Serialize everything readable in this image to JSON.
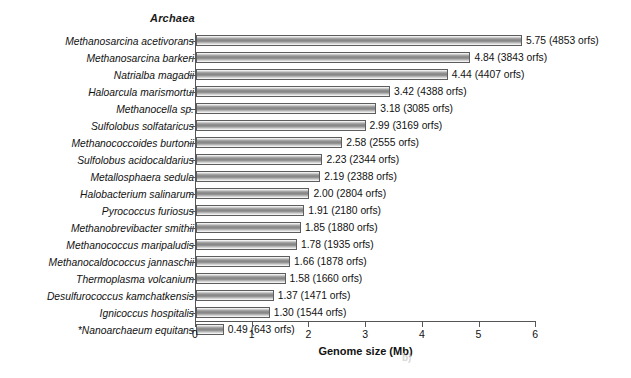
{
  "chart_data": {
    "type": "bar",
    "orientation": "horizontal",
    "title": "Archaea",
    "xlabel": "Genome size (Mb)",
    "ylabel": "",
    "xlim": [
      0,
      6
    ],
    "xticks": [
      0,
      1,
      2,
      3,
      4,
      5,
      6
    ],
    "xtick_labels": [
      "0",
      "1",
      "2",
      "3",
      "4",
      "5",
      "6"
    ],
    "grid": false,
    "legend": null,
    "categories": [
      "Methanosarcina acetivorans",
      "Methanosarcina barkeri",
      "Natrialba magadii",
      "Haloarcula marismortui",
      "Methanocella sp.",
      "Sulfolobus solfataricus",
      "Methanococcoides burtonii",
      "Sulfolobus acidocaldarius",
      "Metallosphaera sedula",
      "Halobacterium salinarum",
      "Pyrococcus furiosus",
      "Methanobrevibacter smithii",
      "Methanococcus maripaludis",
      "Methanocaldococcus jannaschii",
      "Thermoplasma volcanium",
      "Desulfurococcus kamchatkensis",
      "Ignicoccus hospitalis",
      "*Nanoarchaeum equitans"
    ],
    "values": [
      5.75,
      4.84,
      4.44,
      3.42,
      3.18,
      2.99,
      2.58,
      2.23,
      2.19,
      2.0,
      1.91,
      1.85,
      1.78,
      1.66,
      1.58,
      1.37,
      1.3,
      0.49
    ],
    "orfs": [
      4853,
      3843,
      4407,
      4388,
      3085,
      3169,
      2555,
      2344,
      2388,
      2804,
      2180,
      1880,
      1935,
      1878,
      1660,
      1471,
      1544,
      643
    ],
    "data_labels": [
      "5.75 (4853 orfs)",
      "4.84 (3843 orfs)",
      "4.44 (4407 orfs)",
      "3.42 (4388 orfs)",
      "3.18 (3085 orfs)",
      "2.99 (3169 orfs)",
      "2.58 (2555 orfs)",
      "2.23 (2344 orfs)",
      "2.19 (2388 orfs)",
      "2.00 (2804 orfs)",
      "1.91 (2180 orfs)",
      "1.85 (1880 orfs)",
      "1.78 (1935 orfs)",
      "1.66 (1878 orfs)",
      "1.58 (1660 orfs)",
      "1.37 (1471 orfs)",
      "1.30 (1544 orfs)",
      "0.49 (643 orfs)"
    ],
    "bar_color": "#8c8c8c",
    "bar_edge_color": "#5d5d5d"
  },
  "figure": {
    "panel_label": "b)"
  }
}
